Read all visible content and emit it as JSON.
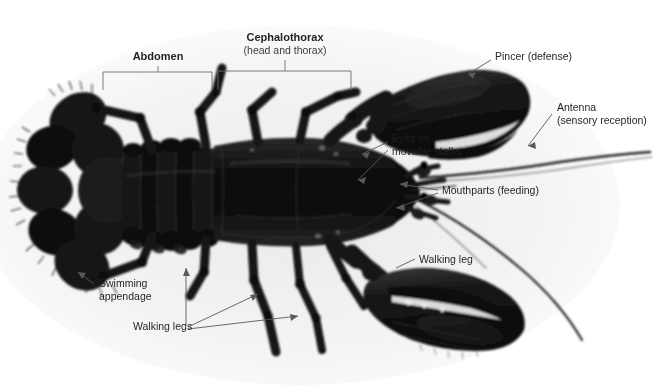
{
  "figure": {
    "background_color": "#ffffff",
    "photo_tint": "#ececec",
    "specimen_color": "#141414",
    "label_color": "#231f20",
    "leader_color": "#58595b",
    "bracket_color": "#6d6e71"
  },
  "labels": {
    "abdomen": {
      "title": "Abdomen",
      "subtitle": "",
      "x": 158,
      "y": 57
    },
    "cephalothorax": {
      "title": "Cephalothorax",
      "subtitle": "(head and thorax)",
      "x": 285,
      "y": 38
    },
    "pincer": {
      "title": "Pincer (defense)",
      "x": 495,
      "y": 57
    },
    "antenna": {
      "title": "Antenna",
      "subtitle": "(sensory reception)",
      "x": 557,
      "y": 108
    },
    "eyes": {
      "title": "Eyes on",
      "subtitle": "movable stalks",
      "x": 392,
      "y": 139
    },
    "mouthparts": {
      "title": "Mouthparts (feeding)",
      "x": 442,
      "y": 190
    },
    "walking_leg": {
      "title": "Walking leg",
      "x": 419,
      "y": 260
    },
    "walking_legs": {
      "title": "Walking legs",
      "x": 133,
      "y": 326
    },
    "swimming_appendage": {
      "title": "Swimming",
      "subtitle": "appendage",
      "x": 97,
      "y": 283
    }
  },
  "brackets": [
    {
      "name": "abdomen-bracket",
      "x1": 103,
      "x2": 212,
      "y": 72,
      "stem_x": 158,
      "stem_y": 68
    },
    {
      "name": "cephalothorax-bracket",
      "x1": 218,
      "x2": 351,
      "y": 71,
      "stem_x": 285,
      "stem_y": 67
    }
  ]
}
